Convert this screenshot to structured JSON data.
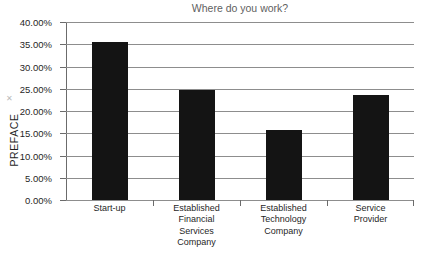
{
  "figure": {
    "side_caption": "PREFACE",
    "broken_image_glyph": "✕",
    "background_color": "#ffffff"
  },
  "chart_data": {
    "type": "bar",
    "title": "Where do you work?",
    "xlabel": "",
    "ylabel": "",
    "categories": [
      "Start-up",
      "Established Financial Services Company",
      "Established Technology Company",
      "Service Provider"
    ],
    "category_lines": [
      [
        "Start-up"
      ],
      [
        "Established",
        "Financial",
        "Services",
        "Company"
      ],
      [
        "Established",
        "Technology",
        "Company"
      ],
      [
        "Service",
        "Provider"
      ]
    ],
    "values": [
      35.5,
      24.7,
      15.8,
      23.6
    ],
    "value_unit": "%",
    "ylim": [
      0,
      40
    ],
    "ytick_step": 5,
    "ytick_labels": [
      "40.00%",
      "35.00%",
      "30.00%",
      "25.00%",
      "20.00%",
      "15.00%",
      "10.00%",
      "5.00%",
      "0.00%"
    ],
    "ytick_values": [
      40,
      35,
      30,
      25,
      20,
      15,
      10,
      5,
      0
    ],
    "grid": true,
    "legend": false,
    "bar_color": "#141414",
    "grid_color": "#8d8d8d",
    "axis_color": "#6b6b6b",
    "title_color": "#5f5f5f"
  }
}
